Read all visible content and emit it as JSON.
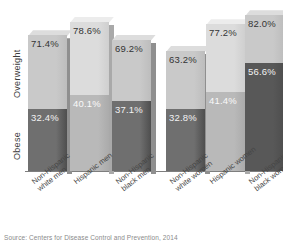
{
  "source_note": "Source: Centers for Disease Control and Prevention, 2014",
  "axis": {
    "category_top": "Overweight",
    "category_bottom": "Obese"
  },
  "chart_data": {
    "type": "bar",
    "title": "",
    "xlabel": "",
    "ylabel": "",
    "stacked": true,
    "ylim": [
      0,
      100
    ],
    "grid": false,
    "legend_position": "y-axis-labels",
    "categories": [
      "Non-Hispanic white men",
      "Hispanic men",
      "Non-Hispanic black men",
      "Non-Hispanic white women",
      "Hispanic women",
      "Non-Hispanic black women"
    ],
    "groups": [
      {
        "name": "Men",
        "categories": [
          "Non-Hispanic white men",
          "Hispanic men",
          "Non-Hispanic black men"
        ]
      },
      {
        "name": "Women",
        "categories": [
          "Non-Hispanic white women",
          "Hispanic women",
          "Non-Hispanic black women"
        ]
      }
    ],
    "series": [
      {
        "name": "Overweight",
        "values": [
          71.4,
          78.6,
          69.2,
          63.2,
          77.2,
          82.0
        ],
        "labels": [
          "71.4%",
          "78.6%",
          "69.2%",
          "63.2%",
          "77.2%",
          "82.0%"
        ]
      },
      {
        "name": "Obese",
        "values": [
          32.4,
          40.1,
          37.1,
          32.8,
          41.4,
          56.6
        ],
        "labels": [
          "32.4%",
          "40.1%",
          "37.1%",
          "32.8%",
          "41.4%",
          "56.6%"
        ]
      }
    ]
  },
  "bars": [
    {
      "category_line1": "Non-Hispanic",
      "category_line2": "white men",
      "overweight_label": "71.4%",
      "obese_label": "32.4%",
      "overweight_value": 71.4,
      "obese_value": 32.4
    },
    {
      "category_line1": "Hispanic men",
      "category_line2": "",
      "overweight_label": "78.6%",
      "obese_label": "40.1%",
      "overweight_value": 78.6,
      "obese_value": 40.1
    },
    {
      "category_line1": "Non-Hispanic",
      "category_line2": "black men",
      "overweight_label": "69.2%",
      "obese_label": "37.1%",
      "overweight_value": 69.2,
      "obese_value": 37.1
    },
    {
      "category_line1": "Non-Hispanic",
      "category_line2": "white women",
      "overweight_label": "63.2%",
      "obese_label": "32.8%",
      "overweight_value": 63.2,
      "obese_value": 32.8
    },
    {
      "category_line1": "Hispanic women",
      "category_line2": "",
      "overweight_label": "77.2%",
      "obese_label": "41.4%",
      "overweight_value": 77.2,
      "obese_value": 41.4
    },
    {
      "category_line1": "Non-Hispanic",
      "category_line2": "black women",
      "overweight_label": "82.0%",
      "obese_label": "56.6%",
      "overweight_value": 82.0,
      "obese_value": 56.6
    }
  ],
  "colors": {
    "overweight_light": "#c9c9c9",
    "overweight_lighter": "#dcdcdc",
    "obese_dark": "#6f6f6f",
    "obese_darker": "#585858",
    "background": "#ffffff",
    "axis_line": "#7e7e7e",
    "label_dark": "#3a3a3a",
    "label_light": "#f2f2f2"
  }
}
